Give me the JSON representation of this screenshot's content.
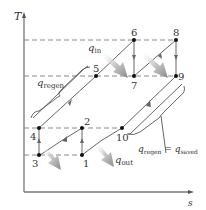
{
  "diagram": {
    "axes": {
      "y_label": "T",
      "x_label": "s"
    },
    "states": [
      {
        "id": "1",
        "label": "1",
        "x": 82,
        "y": 155
      },
      {
        "id": "2",
        "label": "2",
        "x": 82,
        "y": 128
      },
      {
        "id": "3",
        "label": "3",
        "x": 39,
        "y": 155
      },
      {
        "id": "4",
        "label": "4",
        "x": 39,
        "y": 128
      },
      {
        "id": "5",
        "label": "5",
        "x": 96,
        "y": 76
      },
      {
        "id": "6",
        "label": "6",
        "x": 134,
        "y": 40
      },
      {
        "id": "7",
        "label": "7",
        "x": 134,
        "y": 76
      },
      {
        "id": "8",
        "label": "8",
        "x": 176,
        "y": 40
      },
      {
        "id": "9",
        "label": "9",
        "x": 176,
        "y": 76
      },
      {
        "id": "10",
        "label": "10",
        "x": 122,
        "y": 128
      }
    ],
    "heat_labels": {
      "q_in": {
        "base": "q",
        "sub": "in"
      },
      "q_out": {
        "base": "q",
        "sub": "out"
      },
      "q_regen": {
        "base": "q",
        "sub": "regen"
      },
      "q_regen_eq_saved": {
        "base1": "q",
        "sub1": "regen",
        "eq": " = ",
        "base2": "q",
        "sub2": "saved"
      }
    },
    "colors": {
      "line": "#555555",
      "dashed": "#777777",
      "point": "#111111",
      "heat_arrow": "#9a9a9a"
    }
  }
}
